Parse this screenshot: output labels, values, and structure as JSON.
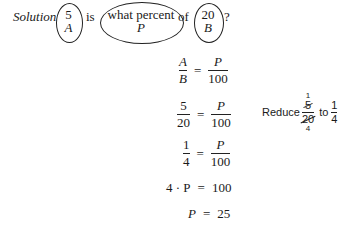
{
  "problem": {
    "label": "Solution",
    "parts": [
      {
        "top": "5",
        "bottom": "A"
      },
      {
        "text": "is"
      },
      {
        "top": "what percent",
        "bottom": "P"
      },
      {
        "text": "of"
      },
      {
        "top": "20",
        "bottom": "B"
      },
      {
        "text": "?"
      }
    ]
  },
  "steps": [
    {
      "lhs_num": "A",
      "lhs_den": "B",
      "eq": "=",
      "rhs_num": "P",
      "rhs_den": "100"
    },
    {
      "lhs_num": "5",
      "lhs_den": "20",
      "eq": "=",
      "rhs_num": "P",
      "rhs_den": "100"
    },
    {
      "lhs_num": "1",
      "lhs_den": "4",
      "eq": "=",
      "rhs_num": "P",
      "rhs_den": "100"
    },
    {
      "lhs": "4 · P",
      "eq": "=",
      "rhs": "100"
    },
    {
      "lhs": "P",
      "eq": "=",
      "rhs": "25"
    }
  ],
  "note": {
    "reduce_label": "Reduce",
    "orig_num": "5",
    "orig_den": "20",
    "cancel_num": "1",
    "cancel_den": "4",
    "to_label": "to",
    "result_num": "1",
    "result_den": "4"
  }
}
